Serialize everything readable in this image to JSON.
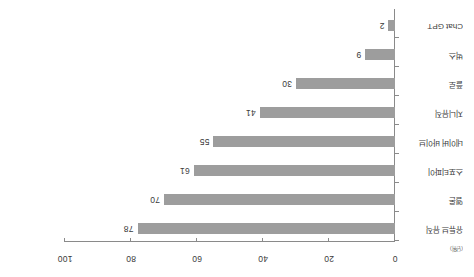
{
  "chart_data": {
    "type": "bar",
    "orientation": "horizontal",
    "title": "",
    "subtitle": "",
    "xlabel": "",
    "ylabel": "",
    "unit_note": "(단위)",
    "xlim": [
      0,
      100
    ],
    "grid": false,
    "legend": null,
    "axis_ticks": [
      "0",
      "20",
      "40",
      "60",
      "80",
      "100"
    ],
    "axis_tick_values": [
      0,
      20,
      40,
      60,
      80,
      100
    ],
    "categories": [
      "유튜브 뮤직",
      "멜론",
      "스포티파이",
      "네이버 바이브",
      "지니뮤직",
      "플로",
      "벅스",
      "Chat GPT"
    ],
    "values": [
      78,
      70,
      61,
      55,
      41,
      30,
      9,
      2
    ],
    "value_labels": [
      "78",
      "70",
      "61",
      "55",
      "41",
      "30",
      "9",
      "2"
    ],
    "bar_color": "#9d9d9d",
    "axis_color": "#8a8a8a",
    "text_color": "#3a3a3a"
  }
}
